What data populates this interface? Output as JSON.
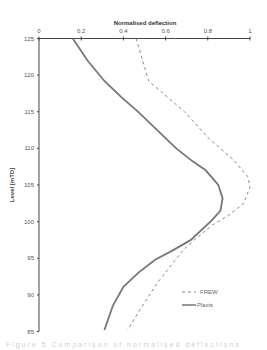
{
  "chart_data": {
    "type": "line",
    "title": "Normalised deflection",
    "xlabel": "Normalised deflection",
    "ylabel": "Level [mTD]",
    "x_axis_position": "top",
    "xlim": [
      0,
      1
    ],
    "ylim": [
      85,
      125
    ],
    "xticks": [
      0,
      0.2,
      0.4,
      0.6,
      0.8,
      1
    ],
    "xtick_labels": [
      "0",
      "0.2",
      "0.4",
      "0.6",
      "0.8",
      "1"
    ],
    "yticks": [
      125,
      120,
      115,
      110,
      105,
      100,
      95,
      90,
      85
    ],
    "ytick_labels": [
      "125",
      "120",
      "115",
      "110",
      "105",
      "100",
      "95",
      "90",
      "85"
    ],
    "grid": false,
    "legend_position": "lower right",
    "series": [
      {
        "name": "FREW",
        "style": "dashed",
        "color": "#8a8a8a",
        "points": [
          [
            0.46,
            125
          ],
          [
            0.52,
            119.2
          ],
          [
            0.69,
            115
          ],
          [
            0.81,
            111.2
          ],
          [
            0.92,
            108.5
          ],
          [
            0.99,
            106.1
          ],
          [
            1.0,
            104.7
          ],
          [
            0.97,
            102.5
          ],
          [
            0.9,
            100.9
          ],
          [
            0.82,
            99.5
          ],
          [
            0.74,
            97.6
          ],
          [
            0.68,
            96.0
          ],
          [
            0.62,
            93.8
          ],
          [
            0.56,
            91.6
          ],
          [
            0.49,
            88.5
          ],
          [
            0.42,
            85.2
          ]
        ]
      },
      {
        "name": "Plaxis",
        "style": "solid",
        "color": "#777777",
        "points": [
          [
            0.16,
            125
          ],
          [
            0.23,
            122
          ],
          [
            0.31,
            119.2
          ],
          [
            0.39,
            117
          ],
          [
            0.47,
            115
          ],
          [
            0.56,
            112.5
          ],
          [
            0.65,
            110
          ],
          [
            0.73,
            108.2
          ],
          [
            0.79,
            107
          ],
          [
            0.85,
            105
          ],
          [
            0.87,
            103.2
          ],
          [
            0.86,
            101.5
          ],
          [
            0.82,
            100.2
          ],
          [
            0.72,
            97.5
          ],
          [
            0.63,
            96.0
          ],
          [
            0.55,
            94.8
          ],
          [
            0.47,
            93.0
          ],
          [
            0.4,
            91.1
          ],
          [
            0.35,
            88.5
          ],
          [
            0.31,
            85.2
          ]
        ]
      }
    ]
  },
  "legend": {
    "items": [
      {
        "label": "FREW",
        "style": "dashed"
      },
      {
        "label": "Plaxis",
        "style": "solid"
      }
    ]
  },
  "caption": "Figure 5  Comparison of normalised deflections"
}
